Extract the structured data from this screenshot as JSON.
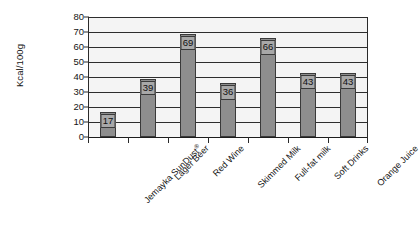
{
  "chart_data": {
    "type": "bar",
    "title": "",
    "xlabel": "",
    "ylabel": "Kcal/100g",
    "ylim": [
      0,
      80
    ],
    "ytick_step": 10,
    "yticks": [
      0,
      10,
      20,
      30,
      40,
      50,
      60,
      70,
      80
    ],
    "ytick_labels": [
      "0",
      "10",
      "20",
      "30",
      "40",
      "50",
      "60",
      "70",
      "80"
    ],
    "grid": "horizontal",
    "legend": "none",
    "bar_color": "#8e8e8e",
    "bar_edge_color": "#3a3a3a",
    "plot_background": "#f4f4f4",
    "label_rotation_degrees": -45,
    "categories": [
      "Jemayka SunDust®",
      "Lager Beer",
      "Red Wine",
      "Skimmed Milk",
      "Full-fat milk",
      "Soft Drinks",
      "Orange Juice"
    ],
    "category_labels_plain": [
      "Jemayka SunDust",
      "Lager Beer",
      "Red Wine",
      "Skimmed Milk",
      "Full-fat milk",
      "Soft Drinks",
      "Orange Juice"
    ],
    "category_trademark_flags": [
      true,
      false,
      false,
      false,
      false,
      false,
      false
    ],
    "values": [
      17,
      39,
      69,
      36,
      66,
      43,
      43
    ],
    "data_labels": [
      "17",
      "39",
      "69",
      "36",
      "66",
      "43",
      "43"
    ],
    "data_labels_shown": true
  }
}
